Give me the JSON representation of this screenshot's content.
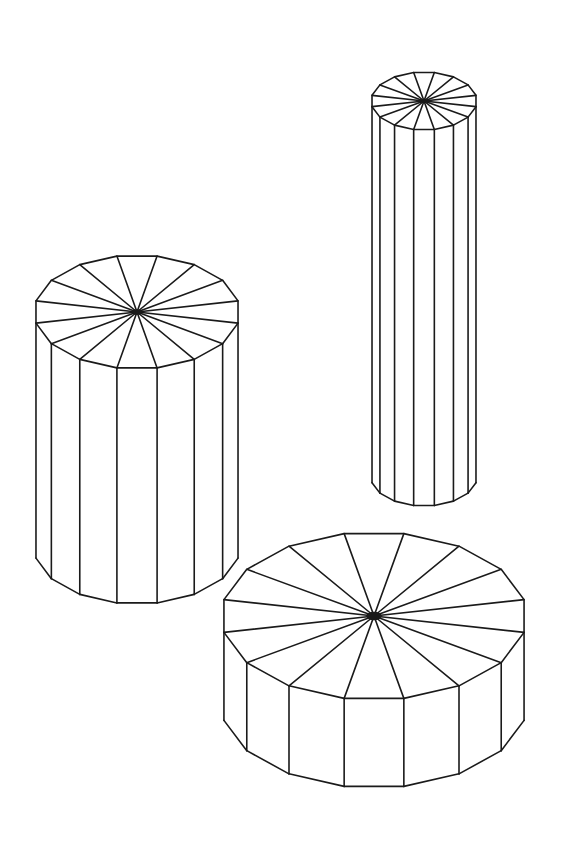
{
  "figure": {
    "stroke_color": "#1a1a1a",
    "background": "#ffffff",
    "shapes": [
      {
        "name": "medium-cylinder",
        "sides": 16,
        "cx": 137,
        "cy": 312,
        "rx": 103,
        "ry": 57,
        "height": 235
      },
      {
        "name": "tall-cylinder",
        "sides": 16,
        "cx": 424,
        "cy": 101,
        "rx": 53,
        "ry": 29,
        "height": 376
      },
      {
        "name": "wide-cylinder",
        "sides": 16,
        "cx": 374,
        "cy": 616,
        "rx": 153,
        "ry": 84,
        "height": 88
      }
    ]
  }
}
